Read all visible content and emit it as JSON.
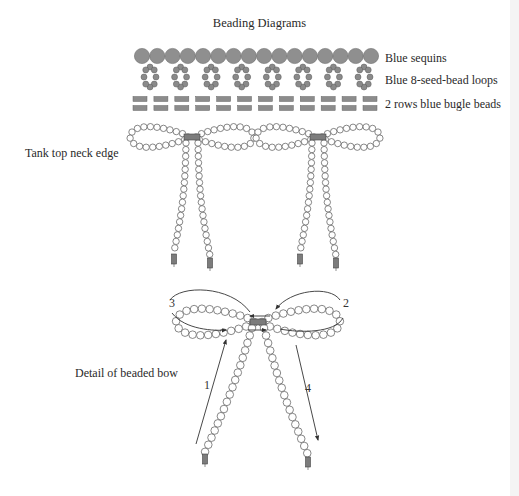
{
  "title": "Beading Diagrams",
  "legend": [
    {
      "label": "Blue sequins",
      "y": 51
    },
    {
      "label": "Blue 8-seed-bead loops",
      "y": 73
    },
    {
      "label": "2 rows blue bugle beads",
      "y": 97
    }
  ],
  "labels": {
    "neck_edge": "Tank top neck edge",
    "detail": "Detail of beaded bow"
  },
  "components": {
    "sequins": {
      "count": 16,
      "x_start": 142,
      "x_end": 371,
      "y": 56,
      "r": 7.6,
      "color": "#8f8f8f"
    },
    "seed_bead_loops": {
      "count": 8,
      "beads_per_loop": 8,
      "x_start": 150,
      "x_end": 364,
      "y_top": 66,
      "y_bottom": 88,
      "color": "#8a8a8a"
    },
    "bugle_beads": {
      "rows": 2,
      "per_row": 12,
      "x_start": 140,
      "x_end": 370,
      "row_y": [
        99,
        108
      ],
      "color": "#8c8c8c"
    }
  },
  "bows": [
    {
      "name": "neck-bow-1",
      "cx": 192,
      "cy": 137,
      "loop_w": 58,
      "loop_h": 14,
      "tail_left_end": [
        174,
        252
      ],
      "tail_right_end": [
        210,
        256
      ]
    },
    {
      "name": "neck-bow-2",
      "cx": 318,
      "cy": 137,
      "loop_w": 58,
      "loop_h": 14,
      "tail_left_end": [
        300,
        252
      ],
      "tail_right_end": [
        336,
        256
      ]
    }
  ],
  "detail_bow": {
    "cx": 258,
    "cy": 322,
    "loop_w": 78,
    "loop_h": 18,
    "tail_left_end": [
      205,
      452
    ],
    "tail_right_end": [
      308,
      455
    ],
    "step_labels": [
      {
        "text": "1",
        "x": 204,
        "y": 389
      },
      {
        "text": "2",
        "x": 343,
        "y": 307
      },
      {
        "text": "3",
        "x": 169,
        "y": 307
      },
      {
        "text": "4",
        "x": 305,
        "y": 392
      }
    ]
  },
  "colors": {
    "bead_outline": "#555555",
    "bead_fill": "#ffffff",
    "bugle": "#7c7c7c",
    "text": "#2a2a2a"
  }
}
